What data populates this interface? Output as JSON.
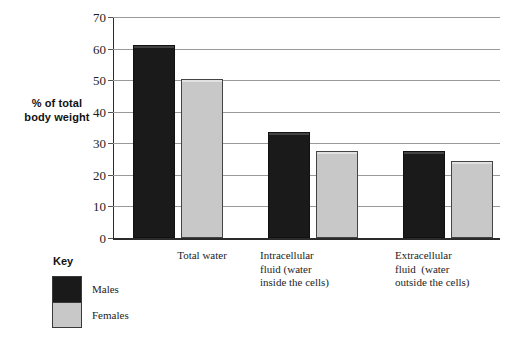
{
  "chart_data": {
    "type": "bar",
    "title": "",
    "xlabel": "",
    "ylabel": "% of total\nbody weight",
    "ylim": [
      0,
      70
    ],
    "ytick_step": 10,
    "yticks": [
      0,
      10,
      20,
      30,
      40,
      50,
      60,
      70
    ],
    "ytick_labels": [
      "0",
      "10",
      "20",
      "30",
      "40",
      "50",
      "60",
      "70"
    ],
    "grid": "horizontal",
    "legend_position": "below-left",
    "categories": [
      "Total water",
      "Intracellular fluid (water inside the cells)",
      "Extracellular fluid  (water outside the cells)"
    ],
    "category_label_lines": [
      [
        "Total water"
      ],
      [
        "Intracellular",
        "fluid (water",
        "inside the cells)"
      ],
      [
        "Extracellular",
        "fluid  (water",
        "outside the cells)"
      ]
    ],
    "series": [
      {
        "name": "Males",
        "color": "#1a1a1a",
        "values": [
          61,
          33.5,
          27.5
        ]
      },
      {
        "name": "Females",
        "color": "#c8c8c8",
        "values": [
          50.5,
          27.5,
          24.5
        ]
      }
    ]
  },
  "axis": {
    "y_title_lines": [
      "% of total",
      "body weight"
    ]
  },
  "key": {
    "title": "Key",
    "entries": [
      {
        "label": "Males",
        "color": "#1a1a1a"
      },
      {
        "label": "Females",
        "color": "#c8c8c8"
      }
    ]
  },
  "colors": {
    "males": "#1a1a1a",
    "females": "#c8c8c8",
    "gridline": "#9a9a9a",
    "axis": "#2b2b2b",
    "text": "#1d1d1d",
    "background": "#ffffff"
  }
}
